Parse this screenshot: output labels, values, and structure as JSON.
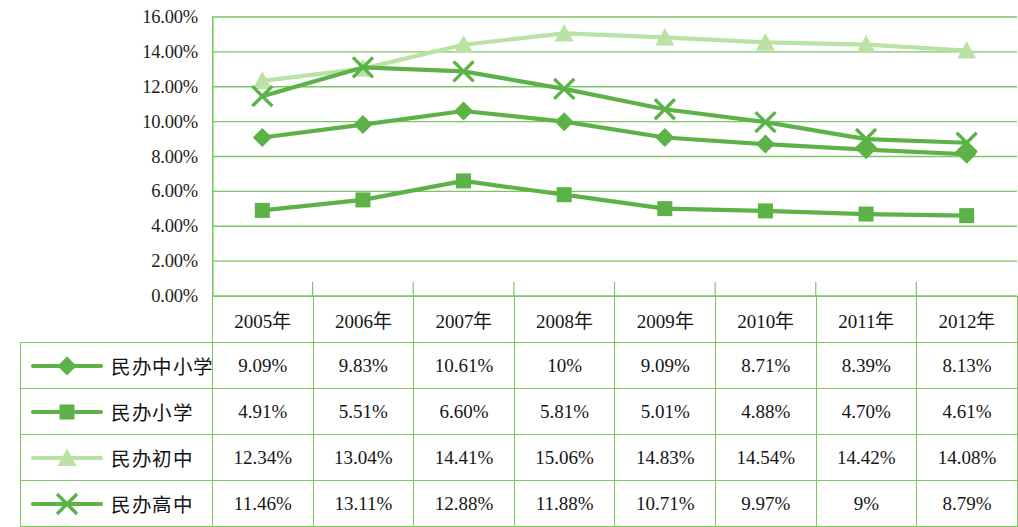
{
  "colors": {
    "grid": "#7cc664",
    "border": "#7cc664",
    "series_main": "#5cb247",
    "series_light": "#b9e2a4",
    "background": "#ffffff",
    "text": "#151515"
  },
  "axis": {
    "y_ticks": [
      "16.00%",
      "14.00%",
      "12.00%",
      "10.00%",
      "8.00%",
      "6.00%",
      "4.00%",
      "2.00%",
      "0.00%"
    ],
    "y_min": 0,
    "y_max": 16,
    "y_step": 2
  },
  "table": {
    "corner_label": "",
    "year_headers": [
      "2005年",
      "2006年",
      "2007年",
      "2008年",
      "2009年",
      "2010年",
      "2011年",
      "2012年"
    ],
    "rows": [
      {
        "label": "民办中小学",
        "marker": "diamond-marker-icon",
        "color": "#5cb247",
        "cells": [
          "9.09%",
          "9.83%",
          "10.61%",
          "10%",
          "9.09%",
          "8.71%",
          "8.39%",
          "8.13%"
        ]
      },
      {
        "label": "民办小学",
        "marker": "square-marker-icon",
        "color": "#5cb247",
        "cells": [
          "4.91%",
          "5.51%",
          "6.60%",
          "5.81%",
          "5.01%",
          "4.88%",
          "4.70%",
          "4.61%"
        ]
      },
      {
        "label": "民办初中",
        "marker": "triangle-marker-icon",
        "color": "#b9e2a4",
        "cells": [
          "12.34%",
          "13.04%",
          "14.41%",
          "15.06%",
          "14.83%",
          "14.54%",
          "14.42%",
          "14.08%"
        ]
      },
      {
        "label": "民办高中",
        "marker": "cross-marker-icon",
        "color": "#5cb247",
        "cells": [
          "11.46%",
          "13.11%",
          "12.88%",
          "11.88%",
          "10.71%",
          "9.97%",
          "9%",
          "8.79%"
        ]
      }
    ]
  },
  "chart_data": {
    "type": "line",
    "title": "",
    "xlabel": "",
    "ylabel": "",
    "categories": [
      "2005年",
      "2006年",
      "2007年",
      "2008年",
      "2009年",
      "2010年",
      "2011年",
      "2012年"
    ],
    "ylim": [
      0,
      16
    ],
    "ytick_step": 2,
    "grid": true,
    "legend": "table-row-left",
    "series": [
      {
        "name": "民办中小学",
        "marker": "diamond",
        "color": "#5cb247",
        "values": [
          9.09,
          9.83,
          10.61,
          10.0,
          9.09,
          8.71,
          8.39,
          8.13
        ]
      },
      {
        "name": "民办小学",
        "marker": "square",
        "color": "#5cb247",
        "values": [
          4.91,
          5.51,
          6.6,
          5.81,
          5.01,
          4.88,
          4.7,
          4.61
        ]
      },
      {
        "name": "民办初中",
        "marker": "triangle",
        "color": "#b9e2a4",
        "values": [
          12.34,
          13.04,
          14.41,
          15.06,
          14.83,
          14.54,
          14.42,
          14.08
        ]
      },
      {
        "name": "民办高中",
        "marker": "cross",
        "color": "#5cb247",
        "values": [
          11.46,
          13.11,
          12.88,
          11.88,
          10.71,
          9.97,
          9.0,
          8.79
        ]
      }
    ]
  }
}
